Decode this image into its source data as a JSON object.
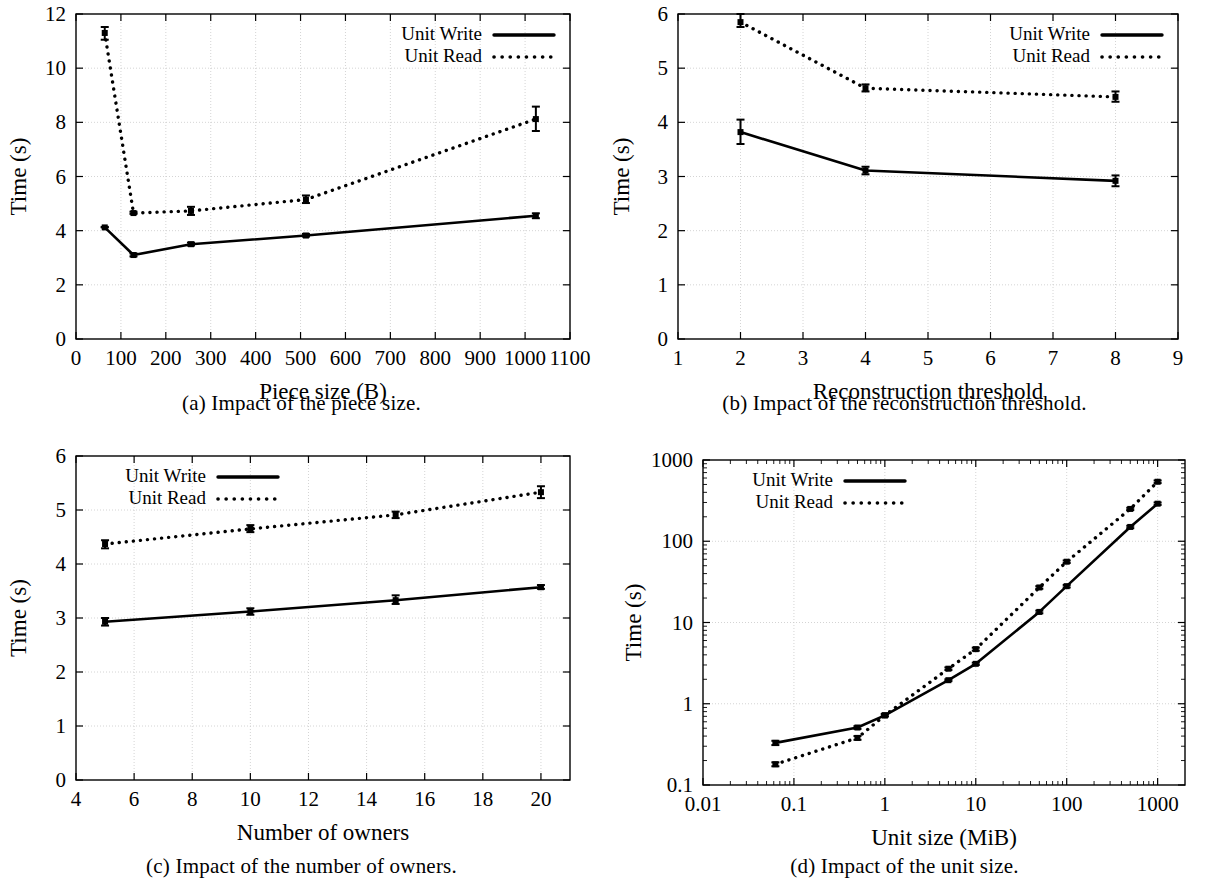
{
  "figure": {
    "panels": [
      {
        "id": "a",
        "caption": "(a) Impact of the piece size.",
        "xlabel": "Piece size (B)",
        "ylabel": "Time (s)",
        "legend": {
          "series1": "Unit Write",
          "series2": "Unit Read"
        },
        "legend_position": "top-right",
        "xticks": [
          "0",
          "100",
          "200",
          "300",
          "400",
          "500",
          "600",
          "700",
          "800",
          "900",
          "1000",
          "1100"
        ],
        "yticks": [
          "0",
          "2",
          "4",
          "6",
          "8",
          "10",
          "12"
        ]
      },
      {
        "id": "b",
        "caption": "(b) Impact of the reconstruction threshold.",
        "xlabel": "Reconstruction threshold",
        "ylabel": "Time (s)",
        "legend": {
          "series1": "Unit Write",
          "series2": "Unit Read"
        },
        "legend_position": "top-right",
        "xticks": [
          "1",
          "2",
          "3",
          "4",
          "5",
          "6",
          "7",
          "8",
          "9"
        ],
        "yticks": [
          "0",
          "1",
          "2",
          "3",
          "4",
          "5",
          "6"
        ]
      },
      {
        "id": "c",
        "caption": "(c) Impact of the number of owners.",
        "xlabel": "Number of owners",
        "ylabel": "Time (s)",
        "legend": {
          "series1": "Unit Write",
          "series2": "Unit Read"
        },
        "legend_position": "top-left",
        "xticks": [
          "4",
          "6",
          "8",
          "10",
          "12",
          "14",
          "16",
          "18",
          "20"
        ],
        "yticks": [
          "0",
          "1",
          "2",
          "3",
          "4",
          "5",
          "6"
        ]
      },
      {
        "id": "d",
        "caption": "(d) Impact of the unit size.",
        "xlabel": "Unit size (MiB)",
        "ylabel": "Time (s)",
        "legend": {
          "series1": "Unit Write",
          "series2": "Unit Read"
        },
        "legend_position": "top-left",
        "xticks": [
          "0.01",
          "0.1",
          "1",
          "10",
          "100",
          "1000"
        ],
        "yticks": [
          "0.1",
          "1",
          "10",
          "100",
          "1000"
        ]
      }
    ]
  },
  "chart_data": [
    {
      "type": "line",
      "panel": "a",
      "title": "(a) Impact of the piece size.",
      "xlabel": "Piece size (B)",
      "ylabel": "Time (s)",
      "xscale": "linear",
      "yscale": "linear",
      "xlim": [
        0,
        1100
      ],
      "ylim": [
        0,
        12
      ],
      "xticks": [
        0,
        100,
        200,
        300,
        400,
        500,
        600,
        700,
        800,
        900,
        1000,
        1100
      ],
      "yticks": [
        0,
        2,
        4,
        6,
        8,
        10,
        12
      ],
      "grid": true,
      "legend": [
        "Unit Write",
        "Unit Read"
      ],
      "legend_position": "top-right",
      "x": [
        64,
        128,
        256,
        512,
        1024
      ],
      "series": [
        {
          "name": "Unit Write",
          "style": "solid",
          "values": [
            4.12,
            3.1,
            3.5,
            3.82,
            4.55
          ],
          "err_low": [
            4.12,
            3.05,
            3.45,
            3.78,
            4.46
          ],
          "err_high": [
            4.14,
            3.16,
            3.56,
            3.88,
            4.64
          ]
        },
        {
          "name": "Unit Read",
          "style": "dotted",
          "values": [
            11.3,
            4.65,
            4.73,
            5.15,
            8.12
          ],
          "err_low": [
            11.05,
            4.62,
            4.58,
            5.02,
            7.68
          ],
          "err_high": [
            11.52,
            4.7,
            4.88,
            5.3,
            8.58
          ]
        }
      ]
    },
    {
      "type": "line",
      "panel": "b",
      "title": "(b) Impact of the reconstruction threshold.",
      "xlabel": "Reconstruction threshold",
      "ylabel": "Time (s)",
      "xscale": "linear",
      "yscale": "linear",
      "xlim": [
        1,
        9
      ],
      "ylim": [
        0,
        6
      ],
      "xticks": [
        1,
        2,
        3,
        4,
        5,
        6,
        7,
        8,
        9
      ],
      "yticks": [
        0,
        1,
        2,
        3,
        4,
        5,
        6
      ],
      "grid": true,
      "legend": [
        "Unit Write",
        "Unit Read"
      ],
      "legend_position": "top-right",
      "x": [
        2,
        4,
        8
      ],
      "series": [
        {
          "name": "Unit Write",
          "style": "solid",
          "values": [
            3.82,
            3.11,
            2.92
          ],
          "err_low": [
            3.6,
            3.04,
            2.82
          ],
          "err_high": [
            4.05,
            3.18,
            3.02
          ]
        },
        {
          "name": "Unit Read",
          "style": "dotted",
          "values": [
            5.85,
            4.63,
            4.47
          ],
          "err_low": [
            5.76,
            4.57,
            4.38
          ],
          "err_high": [
            6.0,
            4.7,
            4.57
          ]
        }
      ]
    },
    {
      "type": "line",
      "panel": "c",
      "title": "(c) Impact of the number of owners.",
      "xlabel": "Number of owners",
      "ylabel": "Time (s)",
      "xscale": "linear",
      "yscale": "linear",
      "xlim": [
        4,
        21
      ],
      "ylim": [
        0,
        6
      ],
      "xticks": [
        4,
        6,
        8,
        10,
        12,
        14,
        16,
        18,
        20
      ],
      "yticks": [
        0,
        1,
        2,
        3,
        4,
        5,
        6
      ],
      "grid": true,
      "legend": [
        "Unit Write",
        "Unit Read"
      ],
      "legend_position": "top-left",
      "x": [
        5,
        10,
        15,
        20
      ],
      "series": [
        {
          "name": "Unit Write",
          "style": "solid",
          "values": [
            2.93,
            3.12,
            3.33,
            3.57
          ],
          "err_low": [
            2.86,
            3.06,
            3.26,
            3.54
          ],
          "err_high": [
            3.0,
            3.18,
            3.42,
            3.61
          ]
        },
        {
          "name": "Unit Read",
          "style": "dotted",
          "values": [
            4.37,
            4.65,
            4.91,
            5.33
          ],
          "err_low": [
            4.29,
            4.59,
            4.85,
            5.22
          ],
          "err_high": [
            4.44,
            4.72,
            4.97,
            5.44
          ]
        }
      ]
    },
    {
      "type": "line",
      "panel": "d",
      "title": "(d) Impact of the unit size.",
      "xlabel": "Unit size (MiB)",
      "ylabel": "Time (s)",
      "xscale": "log",
      "yscale": "log",
      "xlim": [
        0.01,
        2000
      ],
      "ylim": [
        0.1,
        1000
      ],
      "xticks": [
        0.01,
        0.1,
        1,
        10,
        100,
        1000
      ],
      "yticks": [
        0.1,
        1,
        10,
        100,
        1000
      ],
      "grid": true,
      "legend": [
        "Unit Write",
        "Unit Read"
      ],
      "legend_position": "top-left",
      "x": [
        0.0625,
        0.5,
        1,
        5,
        10,
        50,
        100,
        500,
        1000
      ],
      "series": [
        {
          "name": "Unit Write",
          "style": "solid",
          "values": [
            0.33,
            0.51,
            0.72,
            1.95,
            3.1,
            13.5,
            28,
            150,
            290
          ],
          "err_low": [
            0.31,
            0.49,
            0.7,
            1.9,
            3.0,
            13.0,
            27,
            145,
            280
          ],
          "err_high": [
            0.35,
            0.53,
            0.75,
            2.0,
            3.2,
            14.0,
            29,
            155,
            300
          ]
        },
        {
          "name": "Unit Read",
          "style": "dotted",
          "values": [
            0.18,
            0.38,
            0.72,
            2.7,
            4.7,
            27,
            56,
            250,
            540
          ],
          "err_low": [
            0.17,
            0.36,
            0.7,
            2.6,
            4.5,
            26,
            54,
            242,
            520
          ],
          "err_high": [
            0.19,
            0.4,
            0.75,
            2.8,
            4.9,
            28,
            58,
            258,
            560
          ]
        }
      ]
    }
  ]
}
